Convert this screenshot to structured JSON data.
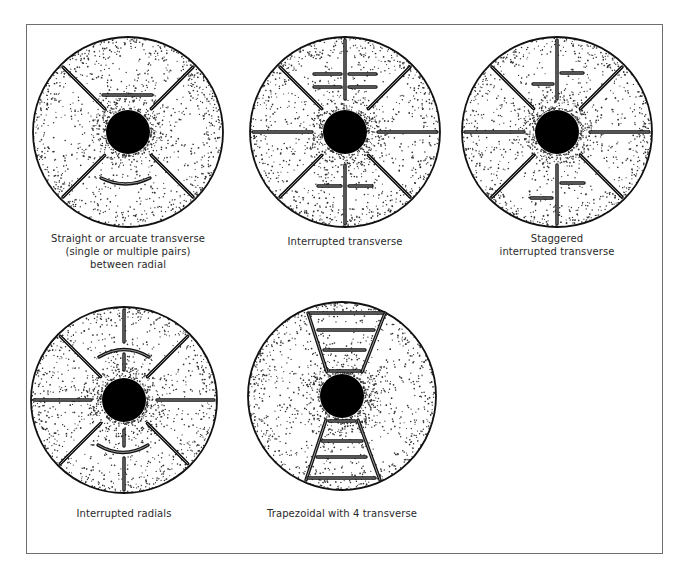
{
  "figure": {
    "ink_color": "#111111",
    "dot_color": "#333333",
    "frame_color": "#6e6e6e",
    "panels": [
      {
        "id": "straight-arcuate",
        "caption": "Straight or arcuate transverse\n(single or multiple pairs)\nbetween radial",
        "center": [
          128,
          132
        ],
        "radius": 95,
        "hub_radius": 22,
        "caption_pos": [
          128,
          232
        ],
        "radials": [
          [
            -2.356,
            33,
            92
          ],
          [
            -0.785,
            33,
            92
          ],
          [
            2.356,
            33,
            92
          ],
          [
            0.785,
            33,
            92
          ]
        ],
        "lines": [
          [
            103,
            95,
            152,
            95
          ]
        ],
        "arcs": [
          [
            101,
            178,
            150,
            178,
            190
          ]
        ]
      },
      {
        "id": "interrupted-transverse",
        "caption": "Interrupted transverse",
        "center": [
          345,
          132
        ],
        "radius": 95,
        "hub_radius": 22,
        "caption_pos": [
          345,
          235
        ],
        "radials": [
          [
            -1.5708,
            33,
            92
          ],
          [
            1.5708,
            33,
            92
          ],
          [
            0,
            33,
            92
          ],
          [
            3.1416,
            33,
            92
          ],
          [
            -2.356,
            33,
            92
          ],
          [
            -0.785,
            33,
            92
          ],
          [
            2.356,
            33,
            92
          ],
          [
            0.785,
            33,
            92
          ]
        ],
        "lines": [
          [
            314,
            74,
            341,
            74
          ],
          [
            349,
            74,
            376,
            74
          ],
          [
            314,
            87,
            341,
            87
          ],
          [
            349,
            87,
            376,
            87
          ],
          [
            318,
            186,
            341,
            186
          ],
          [
            349,
            186,
            372,
            186
          ]
        ],
        "arcs": []
      },
      {
        "id": "staggered-interrupted-transverse",
        "caption": "Staggered\ninterrupted transverse",
        "center": [
          557,
          132
        ],
        "radius": 95,
        "hub_radius": 22,
        "caption_pos": [
          557,
          232
        ],
        "radials": [
          [
            -1.5708,
            33,
            92
          ],
          [
            1.5708,
            33,
            92
          ],
          [
            0,
            33,
            92
          ],
          [
            3.1416,
            33,
            92
          ],
          [
            -2.356,
            33,
            92
          ],
          [
            -0.785,
            33,
            92
          ],
          [
            2.356,
            33,
            92
          ],
          [
            0.785,
            33,
            92
          ]
        ],
        "lines": [
          [
            561,
            73,
            583,
            73
          ],
          [
            533,
            84,
            553,
            84
          ],
          [
            561,
            183,
            584,
            183
          ],
          [
            531,
            198,
            552,
            198
          ]
        ],
        "arcs": []
      },
      {
        "id": "interrupted-radials",
        "caption": "Interrupted radials",
        "center": [
          124,
          400
        ],
        "radius": 93,
        "hub_radius": 22,
        "caption_pos": [
          124,
          507
        ],
        "radials": [
          [
            0,
            33,
            90
          ],
          [
            3.1416,
            33,
            90
          ],
          [
            -2.356,
            33,
            90
          ],
          [
            -0.785,
            33,
            90
          ],
          [
            2.356,
            33,
            90
          ],
          [
            0.785,
            33,
            90
          ],
          [
            -1.5708,
            30,
            46
          ],
          [
            -1.5708,
            58,
            90
          ],
          [
            1.5708,
            30,
            46
          ],
          [
            1.5708,
            58,
            90
          ]
        ],
        "lines": [],
        "arcs": [
          [
            99,
            357,
            149,
            357,
            342
          ],
          [
            98,
            445,
            148,
            445,
            460
          ]
        ]
      },
      {
        "id": "trapezoidal",
        "caption": "Trapezoidal with 4 transverse",
        "center": [
          342,
          396
        ],
        "radius": 94,
        "hub_radius": 22,
        "caption_pos": [
          342,
          507
        ],
        "radials": [],
        "lines": [
          [
            308,
            313,
            327,
            372
          ],
          [
            385,
            313,
            362,
            372
          ],
          [
            310,
            313,
            383,
            313
          ],
          [
            318,
            330,
            374,
            330
          ],
          [
            324,
            350,
            365,
            350
          ],
          [
            330,
            371,
            360,
            371
          ],
          [
            326,
            420,
            306,
            480
          ],
          [
            358,
            420,
            380,
            480
          ],
          [
            329,
            421,
            355,
            421
          ],
          [
            322,
            441,
            362,
            441
          ],
          [
            317,
            457,
            366,
            457
          ],
          [
            308,
            478,
            375,
            478
          ]
        ],
        "arcs": []
      }
    ]
  }
}
